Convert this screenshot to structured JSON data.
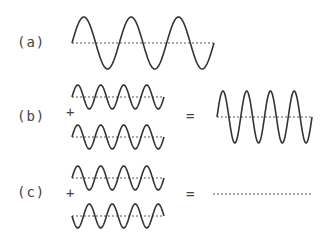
{
  "labels": {
    "a": "(a)",
    "b": "(b)",
    "c": "(c)"
  },
  "operators": {
    "plus": "+",
    "equals": "="
  },
  "colors": {
    "wave": "#333333",
    "axis": "#555555",
    "background": "#ffffff"
  },
  "waves": {
    "a": {
      "x0": 72,
      "x1": 214,
      "mid": 43,
      "amp": 26,
      "cycles": 3,
      "phase": 1
    },
    "b_top": {
      "x0": 72,
      "x1": 164,
      "mid": 97,
      "amp": 12,
      "cycles": 4,
      "phase": 1
    },
    "b_bottom": {
      "x0": 72,
      "x1": 164,
      "mid": 137,
      "amp": 12,
      "cycles": 4,
      "phase": 1
    },
    "b_sum": {
      "x0": 217,
      "x1": 312,
      "mid": 117,
      "amp": 26,
      "cycles": 4,
      "phase": 1
    },
    "c_top": {
      "x0": 72,
      "x1": 164,
      "mid": 178,
      "amp": 12,
      "cycles": 4,
      "phase": 1
    },
    "c_bottom": {
      "x0": 72,
      "x1": 164,
      "mid": 216,
      "amp": 12,
      "cycles": 4,
      "phase": -1
    },
    "c_sum": {
      "x0": 213,
      "x1": 313,
      "mid": 194,
      "amp": 0,
      "cycles": 0,
      "phase": 1
    }
  },
  "caption": "Wave superposition: (a) single wave; (b) constructive interference; (c) destructive interference"
}
